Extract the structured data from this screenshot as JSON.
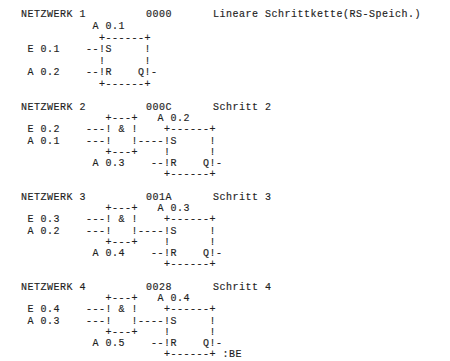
{
  "networks": [
    {
      "title": "NETZWERK 1",
      "address": "0000",
      "comment": "Lineare Schrittkette(RS-Speich.)",
      "lines": [
        "           A 0.1",
        "            +------+",
        " E 0.1    --!S     !",
        "            !      !",
        " A 0.2    --!R    Q!-",
        "            +------+"
      ]
    },
    {
      "title": "NETZWERK 2",
      "address": "000C",
      "comment": "Schritt 2",
      "lines": [
        "             +---+   A 0.2",
        " E 0.2    ---! & !    +------+",
        " A 0.1    ---!   !----!S     !",
        "             +---+    !      !",
        "           A 0.3    --!R    Q!-",
        "                      +------+"
      ]
    },
    {
      "title": "NETZWERK 3",
      "address": "001A",
      "comment": "Schritt 3",
      "lines": [
        "             +---+   A 0.3",
        " E 0.3    ---! & !    +------+",
        " A 0.2    ---!   !----!S     !",
        "             +---+    !      !",
        "           A 0.4    --!R    Q!-",
        "                      +------+"
      ]
    },
    {
      "title": "NETZWERK 4",
      "address": "0028",
      "comment": "Schritt 4",
      "lines": [
        "             +---+   A 0.4",
        " E 0.4    ---! & !    +------+",
        " A 0.3    ---!   !----!S     !",
        "             +---+    !      !",
        "           A 0.5    --!R    Q!-",
        "                      +------+ :BE"
      ]
    }
  ]
}
